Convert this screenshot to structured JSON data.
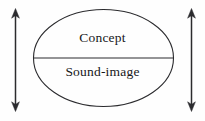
{
  "figure": {
    "name": "saussure-sign-diagram",
    "caption": "",
    "background_color": "#fefefe",
    "stroke_color": "#2b2b2e",
    "text_color": "#17171a"
  },
  "ellipse": {
    "label": "sign-ellipse",
    "center_x": 103.5,
    "center_y": 58,
    "radius_x": 70,
    "radius_y": 48.5,
    "stroke_width": 1.1
  },
  "divider": {
    "label": "ellipse-divider-line",
    "x1": 33.5,
    "x2": 173.5,
    "y": 58,
    "stroke_width": 1.1
  },
  "compartments": {
    "upper": {
      "name": "concept-compartment",
      "text": "Concept"
    },
    "lower": {
      "name": "sound-image-compartment",
      "text": "Sound-image"
    }
  },
  "arrows": [
    {
      "name": "left-double-arrow",
      "x": 15.5,
      "y_top": 9,
      "y_bottom": 111,
      "double_headed": true,
      "stroke_width": 1.4,
      "head_width": 8,
      "head_length": 9
    },
    {
      "name": "right-double-arrow",
      "x": 191.5,
      "y_top": 9,
      "y_bottom": 111,
      "double_headed": true,
      "stroke_width": 1.4,
      "head_width": 8,
      "head_length": 9
    }
  ]
}
